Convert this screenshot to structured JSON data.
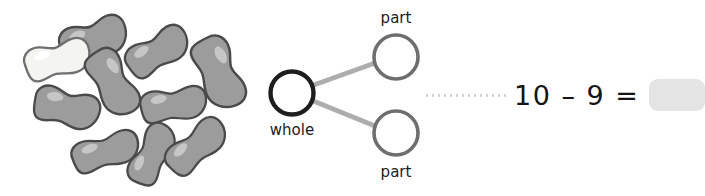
{
  "page": {
    "background_color": "#ffffff",
    "width": 652,
    "height": 196,
    "kind": "math-worksheet-subtraction-problem"
  },
  "counters": {
    "label": "bean counters",
    "total_count": 10,
    "gray_count": 9,
    "white_count": 1,
    "colors": {
      "gray_fill": "#9c9c9c",
      "gray_outline": "#4a4a4a",
      "gray_highlight": "#c2c2c2",
      "white_fill": "#f2f2f0",
      "white_outline": "#6b6b6b",
      "white_highlight": "#fdfdfc"
    },
    "beans": [
      {
        "name": "bean-1",
        "shade": "gray",
        "cx": 93,
        "cy": 40,
        "rx": 36,
        "ry": 20,
        "rot": -18
      },
      {
        "name": "bean-2",
        "shade": "gray",
        "cx": 155,
        "cy": 52,
        "rx": 34,
        "ry": 18,
        "rot": -32
      },
      {
        "name": "bean-3",
        "shade": "white",
        "cx": 57,
        "cy": 60,
        "rx": 35,
        "ry": 18,
        "rot": -12
      },
      {
        "name": "bean-4",
        "shade": "gray",
        "cx": 112,
        "cy": 81,
        "rx": 34,
        "ry": 20,
        "rot": 58
      },
      {
        "name": "bean-5",
        "shade": "gray",
        "cx": 217,
        "cy": 72,
        "rx": 36,
        "ry": 21,
        "rot": 66
      },
      {
        "name": "bean-6",
        "shade": "gray",
        "cx": 65,
        "cy": 107,
        "rx": 33,
        "ry": 19,
        "rot": 14
      },
      {
        "name": "bean-7",
        "shade": "gray",
        "cx": 172,
        "cy": 105,
        "rx": 34,
        "ry": 17,
        "rot": -8
      },
      {
        "name": "bean-8",
        "shade": "gray",
        "cx": 105,
        "cy": 152,
        "rx": 35,
        "ry": 17,
        "rot": -16
      },
      {
        "name": "bean-9",
        "shade": "gray",
        "cx": 152,
        "cy": 155,
        "rx": 33,
        "ry": 17,
        "rot": -62
      },
      {
        "name": "bean-10",
        "shade": "gray",
        "cx": 194,
        "cy": 148,
        "rx": 34,
        "ry": 18,
        "rot": -40
      }
    ]
  },
  "number_bond": {
    "title": "number bond diagram",
    "whole": {
      "label": "whole",
      "value": "",
      "cx": 37,
      "cy": 31,
      "r": 21,
      "stroke": "#1e1e1e",
      "stroke_width": 4.5
    },
    "parts": [
      {
        "label": "part",
        "value": "",
        "cx": 139,
        "cy": -5,
        "r": 22,
        "stroke": "#6e6e6e",
        "stroke_width": 3.6,
        "label_position": "above"
      },
      {
        "label": "part",
        "value": "",
        "cx": 139,
        "cy": 67,
        "r": 22,
        "stroke": "#6e6e6e",
        "stroke_width": 3.6,
        "label_position": "below"
      }
    ],
    "connector_color": "#adadad",
    "connector_width": 4.5,
    "label_color": "#1c1c1c"
  },
  "equation": {
    "leader": "dotted-leader-line",
    "leader_color": "#cdcdcd",
    "expression": "10 – 9 =",
    "minuend": "10",
    "operator": "–",
    "subtrahend": "9",
    "equals": "=",
    "answer_value": "",
    "answer_box_color": "#e4e4e4",
    "text_color": "#141414"
  }
}
